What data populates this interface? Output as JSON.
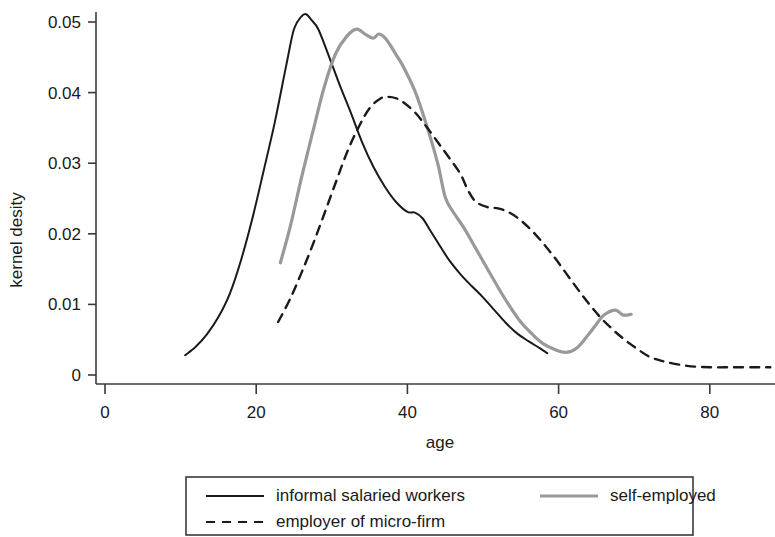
{
  "chart_data": {
    "type": "line",
    "title": "",
    "xlabel": "age",
    "ylabel": "kernel desity",
    "xlim": [
      0,
      88
    ],
    "ylim": [
      0,
      0.053
    ],
    "grid": false,
    "legend_position": "bottom",
    "x_ticks": [
      0,
      20,
      40,
      60,
      80
    ],
    "x_tick_labels": [
      "0",
      "20",
      "40",
      "60",
      "80"
    ],
    "y_ticks": [
      0,
      0.01,
      0.02,
      0.03,
      0.04,
      0.05
    ],
    "y_tick_labels": [
      "0",
      "0.01",
      "0.02",
      "0.03",
      "0.04",
      "0.05"
    ],
    "series": [
      {
        "name": "informal salaried workers",
        "color": "#1a1a1a",
        "style": "solid",
        "width": 2.0,
        "x": [
          10.6,
          12.0,
          13.5,
          15.0,
          16.5,
          18.0,
          19.5,
          21.0,
          22.5,
          24.0,
          25.0,
          26.0,
          26.6,
          27.3,
          28.2,
          29.5,
          31.0,
          32.5,
          34.0,
          35.5,
          37.0,
          38.5,
          40.0,
          41.0,
          42.0,
          43.0,
          44.0,
          45.5,
          47.0,
          48.5,
          50.0,
          51.5,
          53.0,
          54.5,
          56.0,
          57.5,
          58.5
        ],
        "y": [
          0.0028,
          0.004,
          0.0058,
          0.0082,
          0.0115,
          0.0163,
          0.0222,
          0.029,
          0.036,
          0.044,
          0.049,
          0.0508,
          0.0511,
          0.0503,
          0.049,
          0.0455,
          0.0412,
          0.0372,
          0.033,
          0.0295,
          0.0267,
          0.0245,
          0.0231,
          0.023,
          0.0222,
          0.0205,
          0.0188,
          0.0163,
          0.0143,
          0.0126,
          0.011,
          0.0092,
          0.0074,
          0.0059,
          0.0048,
          0.0038,
          0.0031
        ]
      },
      {
        "name": "self-employed",
        "color": "#999999",
        "style": "solid",
        "width": 3.2,
        "x": [
          23.2,
          24.5,
          26.0,
          27.5,
          29.0,
          30.5,
          32.0,
          33.3,
          34.5,
          35.5,
          36.2,
          37.0,
          37.8,
          38.6,
          39.5,
          41.0,
          42.5,
          44.0,
          45.0,
          46.0,
          47.5,
          49.0,
          50.5,
          52.0,
          53.5,
          55.0,
          56.5,
          58.0,
          59.5,
          61.0,
          62.5,
          64.0,
          65.0,
          66.0,
          67.5,
          68.5,
          69.6
        ],
        "y": [
          0.0159,
          0.021,
          0.028,
          0.0345,
          0.0408,
          0.0455,
          0.048,
          0.049,
          0.0482,
          0.0477,
          0.0483,
          0.0478,
          0.0466,
          0.0452,
          0.0436,
          0.0402,
          0.0355,
          0.03,
          0.0252,
          0.0232,
          0.0208,
          0.018,
          0.0152,
          0.0124,
          0.0098,
          0.0075,
          0.0058,
          0.0044,
          0.0036,
          0.0032,
          0.0039,
          0.0058,
          0.0072,
          0.0085,
          0.0092,
          0.0085,
          0.0086
        ]
      },
      {
        "name": "employer of micro-firm",
        "color": "#1a1a1a",
        "style": "dashed",
        "width": 2.4,
        "x": [
          22.9,
          24.5,
          26.0,
          27.5,
          29.0,
          30.5,
          32.0,
          33.5,
          35.0,
          36.5,
          37.5,
          38.5,
          39.5,
          41.0,
          42.5,
          44.0,
          45.5,
          47.0,
          48.0,
          49.0,
          50.5,
          52.0,
          53.5,
          55.0,
          56.5,
          58.0,
          59.5,
          61.0,
          62.5,
          64.0,
          65.5,
          67.0,
          68.5,
          70.0,
          72.0,
          74.0,
          77.0,
          80.0,
          83.0,
          86.0,
          88.0
        ],
        "y": [
          0.0075,
          0.0108,
          0.0145,
          0.0185,
          0.0228,
          0.0272,
          0.0315,
          0.035,
          0.0378,
          0.0392,
          0.0394,
          0.0392,
          0.0386,
          0.0372,
          0.0352,
          0.033,
          0.0308,
          0.0285,
          0.0262,
          0.0246,
          0.0238,
          0.0236,
          0.023,
          0.0219,
          0.0204,
          0.0186,
          0.0166,
          0.0144,
          0.0122,
          0.0101,
          0.0082,
          0.0066,
          0.0052,
          0.004,
          0.0026,
          0.0019,
          0.0013,
          0.0011,
          0.0011,
          0.0011,
          0.0011
        ]
      }
    ],
    "legend": [
      {
        "label": "informal salaried workers",
        "color": "#1a1a1a",
        "style": "solid"
      },
      {
        "label": "self-employed",
        "color": "#999999",
        "style": "solid"
      },
      {
        "label": "employer of micro-firm",
        "color": "#1a1a1a",
        "style": "dashed"
      }
    ]
  }
}
